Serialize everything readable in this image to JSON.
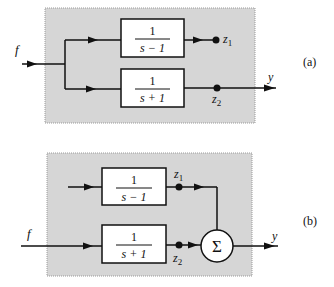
{
  "diagrams": [
    {
      "id": "a",
      "caption": "(a)",
      "input_label": "f",
      "output_label": "y",
      "blocks": [
        {
          "numerator": "1",
          "denominator": "s − 1"
        },
        {
          "numerator": "1",
          "denominator": "s + 1"
        }
      ],
      "nodes": [
        {
          "label": "z",
          "subscript": "1"
        },
        {
          "label": "z",
          "subscript": "2"
        }
      ]
    },
    {
      "id": "b",
      "caption": "(b)",
      "input_label": "f",
      "output_label": "y",
      "blocks": [
        {
          "numerator": "1",
          "denominator": "s − 1"
        },
        {
          "numerator": "1",
          "denominator": "s + 1"
        }
      ],
      "nodes": [
        {
          "label": "z",
          "subscript": "1"
        },
        {
          "label": "z",
          "subscript": "2"
        }
      ],
      "summing_junction": "Σ"
    }
  ],
  "colors": {
    "shaded_region": "#d6d6d6",
    "line": "#111111",
    "block_fill": "#ffffff"
  }
}
